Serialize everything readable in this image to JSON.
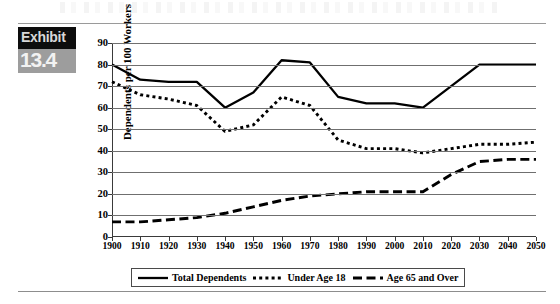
{
  "exhibit": {
    "word": "Exhibit",
    "number": "13.4"
  },
  "chart_data": {
    "type": "line",
    "title": "",
    "xlabel": "",
    "ylabel": "Dependents per 100 Workers",
    "xlim": [
      1900,
      2050
    ],
    "ylim": [
      0,
      90
    ],
    "ytick_step": 10,
    "grid": true,
    "legend_position": "bottom",
    "categories": [
      "1900",
      "1910",
      "1920",
      "1930",
      "1940",
      "1950",
      "1960",
      "1970",
      "1980",
      "1990",
      "2000",
      "2010",
      "2020",
      "2030",
      "2040",
      "2050"
    ],
    "yticks": [
      "0",
      "10",
      "20",
      "30",
      "40",
      "50",
      "60",
      "70",
      "80",
      "90"
    ],
    "series": [
      {
        "name": "Total Dependents",
        "style": "solid",
        "color": "#000000",
        "values": [
          80,
          73,
          72,
          72,
          60,
          67,
          82,
          81,
          65,
          62,
          62,
          60,
          70,
          80,
          80,
          80
        ]
      },
      {
        "name": "Under Age 18",
        "style": "dotted",
        "color": "#000000",
        "values": [
          72,
          66,
          64,
          61,
          49,
          52,
          65,
          61,
          45,
          41,
          41,
          39,
          41,
          43,
          43,
          44
        ]
      },
      {
        "name": "Age 65 and Over",
        "style": "dashed",
        "color": "#000000",
        "values": [
          7,
          7,
          8,
          9,
          11,
          14,
          17,
          19,
          20,
          21,
          21,
          21,
          29,
          35,
          36,
          36
        ]
      }
    ]
  }
}
